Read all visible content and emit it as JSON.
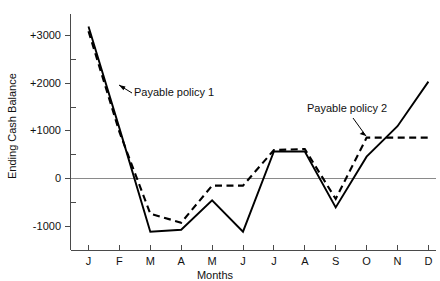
{
  "chart_data": {
    "type": "line",
    "title": "",
    "xlabel": "Months",
    "ylabel": "Ending Cash Balance",
    "categories": [
      "J",
      "F",
      "M",
      "A",
      "M",
      "J",
      "J",
      "A",
      "S",
      "O",
      "N",
      "D"
    ],
    "x_tick_labels": [
      "J",
      "F",
      "M",
      "A",
      "M",
      "J",
      "J",
      "A",
      "S",
      "O",
      "N",
      "D"
    ],
    "y_tick_labels": [
      "+3000",
      "+2000",
      "+1000",
      "0",
      "-1000"
    ],
    "y_tick_values": [
      3000,
      2000,
      1000,
      0,
      -1000
    ],
    "y_minor_tick_values": [
      3500,
      2500,
      1500,
      500,
      -500,
      -1500
    ],
    "ylim": [
      -1500,
      3500
    ],
    "grid": false,
    "legend_position": "inline-annotations",
    "series": [
      {
        "name": "Payable policy 1",
        "style": "solid",
        "values": [
          3200,
          1060,
          -1120,
          -1080,
          -460,
          -1120,
          570,
          570,
          -610,
          460,
          1100,
          2040
        ]
      },
      {
        "name": "Payable policy 2",
        "style": "dashed",
        "values": [
          3100,
          980,
          -740,
          -930,
          -150,
          -150,
          600,
          620,
          -430,
          860,
          860,
          860
        ]
      }
    ],
    "annotations": [
      {
        "text": "Payable policy 1",
        "target_x": "between F and M",
        "target_value": 1550
      },
      {
        "text": "Payable policy 2",
        "target_x": "O",
        "target_value": 860
      }
    ]
  },
  "axis": {
    "y_label": "Ending Cash Balance",
    "x_label": "Months",
    "y_ticks": [
      "+3000",
      "+2000",
      "+1000",
      "0",
      "-1000"
    ],
    "x_ticks": [
      "J",
      "F",
      "M",
      "A",
      "M",
      "J",
      "J",
      "A",
      "S",
      "O",
      "N",
      "D"
    ]
  },
  "annotations": {
    "policy1": "Payable policy 1",
    "policy2": "Payable policy 2"
  },
  "colors": {
    "background": "#ffffff",
    "series": "#000000",
    "axis": "#4a4a4a",
    "zero_line": "#8a8a8a",
    "text": "#111111"
  }
}
